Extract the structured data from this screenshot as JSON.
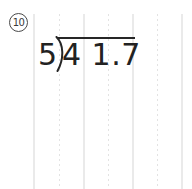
{
  "page": {
    "kind": "math-worksheet",
    "background_color": "#ffffff",
    "ink_color": "#222222",
    "rule_color": "#eaeaea"
  },
  "problem": {
    "number_label": "10",
    "number_style": "circled",
    "operation": "long-division",
    "divisor": "5",
    "dividend": "4 1.7",
    "dividend_value": "41.7",
    "quotient": "",
    "bracket_glyph": ")",
    "expression_text": "5)41.7"
  },
  "ruled_lines": {
    "orientation": "vertical",
    "start_y": 14,
    "spacing_px": 24.7,
    "solid_x": [
      34,
      84,
      133,
      182
    ],
    "dotted_x": [
      59,
      108,
      158
    ],
    "solid_color": "#eaeaea",
    "dotted_color": "#e3e3e3"
  }
}
